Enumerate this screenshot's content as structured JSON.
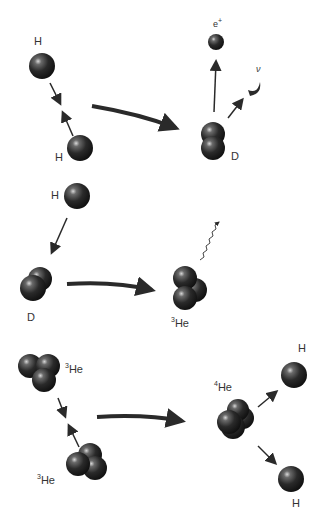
{
  "colors": {
    "particle": "#2a2a2a",
    "arrow": "#2a2a2a",
    "background": "#ffffff"
  },
  "stage1": {
    "label_h1": "H",
    "label_h2": "H",
    "label_d": "D",
    "label_positron": "e",
    "label_positron_sup": "+",
    "label_neutrino": "ν"
  },
  "stage2": {
    "label_h": "H",
    "label_d": "D",
    "label_he3_sup": "3",
    "label_he3": "He"
  },
  "stage3": {
    "label_he3a_sup": "3",
    "label_he3a": "He",
    "label_he3b_sup": "3",
    "label_he3b": "He",
    "label_he4_sup": "4",
    "label_he4": "He",
    "label_h1": "H",
    "label_h2": "H"
  }
}
